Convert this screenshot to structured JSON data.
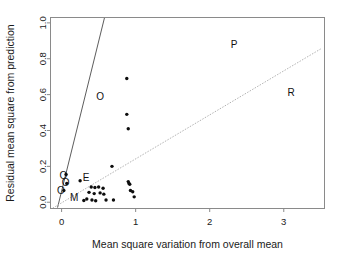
{
  "chart_data": {
    "type": "scatter",
    "title": "",
    "xlabel": "Mean square variation from overall mean",
    "ylabel": "Residual mean square from prediction",
    "xlim": [
      -0.15,
      3.55
    ],
    "ylim": [
      -0.035,
      1.03
    ],
    "xticks": [
      0,
      1,
      2,
      3
    ],
    "xtick_labels": [
      "0",
      "1",
      "2",
      "3"
    ],
    "yticks": [
      0.0,
      0.2,
      0.4,
      0.6,
      0.8,
      1.0
    ],
    "ytick_labels": [
      "0.0",
      "0.2",
      "0.4",
      "0.6",
      "0.8",
      "1.0"
    ],
    "grid": false,
    "legend": "none",
    "points": [
      {
        "x": 0.88,
        "y": 0.69
      },
      {
        "x": 0.88,
        "y": 0.49
      },
      {
        "x": 0.9,
        "y": 0.41
      },
      {
        "x": 0.68,
        "y": 0.2
      },
      {
        "x": 0.06,
        "y": 0.155
      },
      {
        "x": 0.07,
        "y": 0.105
      },
      {
        "x": 0.03,
        "y": 0.065
      },
      {
        "x": 0.25,
        "y": 0.12
      },
      {
        "x": 0.9,
        "y": 0.115
      },
      {
        "x": 0.91,
        "y": 0.105
      },
      {
        "x": 0.92,
        "y": 0.1
      },
      {
        "x": 0.4,
        "y": 0.085
      },
      {
        "x": 0.45,
        "y": 0.082
      },
      {
        "x": 0.5,
        "y": 0.085
      },
      {
        "x": 0.56,
        "y": 0.078
      },
      {
        "x": 0.93,
        "y": 0.065
      },
      {
        "x": 0.96,
        "y": 0.058
      },
      {
        "x": 0.37,
        "y": 0.055
      },
      {
        "x": 0.44,
        "y": 0.048
      },
      {
        "x": 0.52,
        "y": 0.052
      },
      {
        "x": 0.57,
        "y": 0.045
      },
      {
        "x": 0.98,
        "y": 0.03
      },
      {
        "x": 0.3,
        "y": 0.01
      },
      {
        "x": 0.34,
        "y": 0.018
      },
      {
        "x": 0.41,
        "y": 0.012
      },
      {
        "x": 0.46,
        "y": 0.008
      },
      {
        "x": 0.6,
        "y": 0.012
      },
      {
        "x": 0.7,
        "y": 0.012
      }
    ],
    "annotations": [
      {
        "text": "O",
        "x": 0.52,
        "y": 0.585
      },
      {
        "text": "O",
        "x": 0.025,
        "y": 0.145
      },
      {
        "text": "O",
        "x": 0.055,
        "y": 0.105
      },
      {
        "text": "O",
        "x": -0.01,
        "y": 0.062
      },
      {
        "text": "E",
        "x": 0.33,
        "y": 0.135
      },
      {
        "text": "M",
        "x": 0.17,
        "y": 0.022
      },
      {
        "text": "P",
        "x": 2.33,
        "y": 0.875
      },
      {
        "text": "R",
        "x": 3.1,
        "y": 0.605
      }
    ],
    "reference_lines": [
      {
        "name": "steep-solid-line",
        "style": "solid",
        "color": "#4a4a4a",
        "x0": -0.055,
        "y0": -0.03,
        "x1": 0.58,
        "y1": 1.03
      },
      {
        "name": "shallow-dotted-line",
        "style": "dotted",
        "color": "#a9a9a9",
        "x0": -0.12,
        "y0": -0.033,
        "x1": 3.5,
        "y1": 0.855
      }
    ]
  },
  "figure": {
    "background_color": "#ffffff",
    "frame_color": "#8a8a8a",
    "point_color": "#0d0d0d"
  }
}
